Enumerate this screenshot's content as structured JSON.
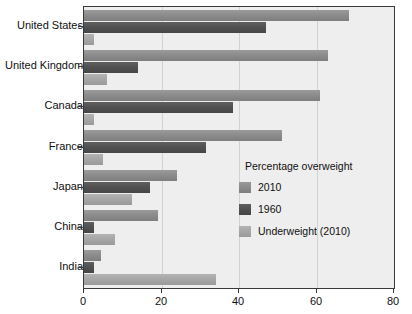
{
  "chart_data": {
    "type": "bar",
    "orientation": "horizontal",
    "title": "",
    "xlabel": "",
    "ylabel": "",
    "xlim": [
      0,
      80
    ],
    "xticks": [
      0,
      20,
      40,
      60,
      80
    ],
    "xticklabels": [
      "0",
      "20",
      "40",
      "60",
      "80"
    ],
    "grid": true,
    "legend_position": "inside-right",
    "legend_title": "Percentage overweight",
    "categories": [
      "United States",
      "United Kingdom",
      "Canada",
      "France",
      "Japan",
      "China",
      "India"
    ],
    "series": [
      {
        "name": "2010",
        "color": "#8c8c8c",
        "values": [
          68.5,
          63,
          61,
          51,
          24,
          19,
          4.5
        ]
      },
      {
        "name": "1960",
        "color": "#515151",
        "values": [
          47,
          14,
          38.5,
          31.5,
          17,
          2.5,
          2.5
        ]
      },
      {
        "name": "Underweight (2010)",
        "color": "#a6a6a6",
        "values": [
          2.5,
          6,
          2.5,
          5,
          12.5,
          8,
          34
        ]
      }
    ]
  },
  "axes": {
    "x_tick_labels": [
      "0",
      "20",
      "40",
      "60",
      "80"
    ],
    "y_tick_labels": [
      "United States",
      "United Kingdom",
      "Canada",
      "France",
      "Japan",
      "China",
      "India"
    ]
  },
  "legend": {
    "title": "Percentage overweight",
    "entries": [
      {
        "label": "2010"
      },
      {
        "label": "1960"
      },
      {
        "label": "Underweight (2010)"
      }
    ]
  }
}
